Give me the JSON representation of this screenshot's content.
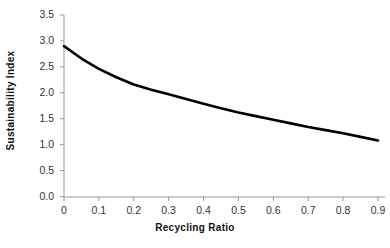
{
  "chart_data": {
    "type": "line",
    "title": "",
    "subtitle": "",
    "xlabel": "Recycling Ratio",
    "ylabel": "Sustainability Index",
    "xlim": [
      0,
      0.95
    ],
    "ylim": [
      0,
      3.5
    ],
    "xticks": [
      "0",
      "0.1",
      "0.2",
      "0.3",
      "0.4",
      "0.5",
      "0.6",
      "0.7",
      "0.8",
      "0.9"
    ],
    "xtick_values": [
      0,
      0.1,
      0.2,
      0.3,
      0.4,
      0.5,
      0.6,
      0.7,
      0.8,
      0.9
    ],
    "yticks": [
      "0.0",
      "0.5",
      "1.0",
      "1.5",
      "2.0",
      "2.5",
      "3.0",
      "3.5"
    ],
    "ytick_values": [
      0.0,
      0.5,
      1.0,
      1.5,
      2.0,
      2.5,
      3.0,
      3.5
    ],
    "grid": false,
    "legend": false,
    "legend_position": "none",
    "line_color": "#000000",
    "line_width": 2.6,
    "axis_color": "#9a9a9a",
    "x": [
      0,
      0.05,
      0.1,
      0.15,
      0.2,
      0.25,
      0.3,
      0.35,
      0.4,
      0.45,
      0.5,
      0.55,
      0.6,
      0.65,
      0.7,
      0.75,
      0.8,
      0.85,
      0.9
    ],
    "values": [
      2.9,
      2.66,
      2.46,
      2.3,
      2.16,
      2.06,
      1.97,
      1.88,
      1.79,
      1.7,
      1.62,
      1.55,
      1.48,
      1.41,
      1.34,
      1.28,
      1.22,
      1.15,
      1.08
    ],
    "series": [
      {
        "name": "Sustainability Index",
        "values": [
          2.9,
          2.66,
          2.46,
          2.3,
          2.16,
          2.06,
          1.97,
          1.88,
          1.79,
          1.7,
          1.62,
          1.55,
          1.48,
          1.41,
          1.34,
          1.28,
          1.22,
          1.15,
          1.08
        ]
      }
    ]
  },
  "axes": {
    "x_title": "Recycling Ratio",
    "y_title": "Sustainability Index"
  }
}
